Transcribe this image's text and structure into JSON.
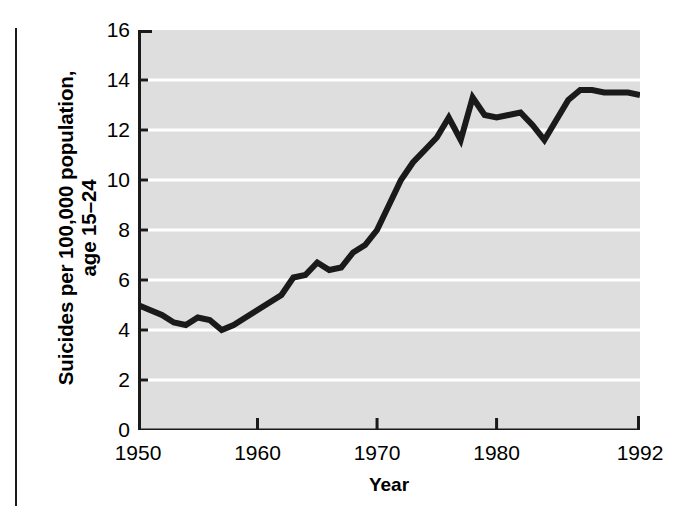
{
  "chart_data": {
    "type": "line",
    "title": "",
    "xlabel": "Year",
    "ylabel": "Suicides per 100,000 population, age 15–24",
    "ylabel_lines": [
      "Suicides per 100,000 population,",
      "age 15–24"
    ],
    "xlim": [
      1950,
      1992
    ],
    "ylim": [
      0,
      16
    ],
    "ytick_labels": [
      "16",
      "14",
      "12",
      "10",
      "8",
      "6",
      "4",
      "2",
      "0"
    ],
    "ytick_values": [
      16,
      14,
      12,
      10,
      8,
      6,
      4,
      2,
      0
    ],
    "xtick_labels": [
      "1950",
      "1960",
      "1970",
      "1980",
      "1992"
    ],
    "xtick_values": [
      1950,
      1960,
      1970,
      1980,
      1992
    ],
    "grid": "horizontal-white-gridlines",
    "legend": "none",
    "plot_background_color": "#dedede",
    "gridline_color": "#ffffff",
    "line_color": "#1a1a1a",
    "line_width_px": 6,
    "series": [
      {
        "name": "Suicides per 100,000 population, age 15-24",
        "x": [
          1950,
          1951,
          1952,
          1953,
          1954,
          1955,
          1956,
          1957,
          1958,
          1959,
          1960,
          1961,
          1962,
          1963,
          1964,
          1965,
          1966,
          1967,
          1968,
          1969,
          1970,
          1971,
          1972,
          1973,
          1974,
          1975,
          1976,
          1977,
          1978,
          1979,
          1980,
          1981,
          1982,
          1983,
          1984,
          1985,
          1986,
          1987,
          1988,
          1989,
          1990,
          1991,
          1992
        ],
        "values": [
          5.0,
          4.8,
          4.6,
          4.3,
          4.2,
          4.5,
          4.4,
          4.0,
          4.2,
          4.5,
          4.8,
          5.1,
          5.4,
          6.1,
          6.2,
          6.7,
          6.4,
          6.5,
          7.1,
          7.4,
          8.0,
          9.0,
          10.0,
          10.7,
          11.2,
          11.7,
          12.5,
          11.6,
          13.3,
          12.6,
          12.5,
          12.6,
          12.7,
          12.2,
          11.6,
          12.4,
          13.2,
          13.6,
          13.6,
          13.5,
          13.5,
          13.5,
          13.4
        ]
      }
    ]
  },
  "figure": {
    "y_axis_title_line1": "Suicides per 100,000 population,",
    "y_axis_title_line2": "age 15–24",
    "x_axis_title": "Year"
  }
}
